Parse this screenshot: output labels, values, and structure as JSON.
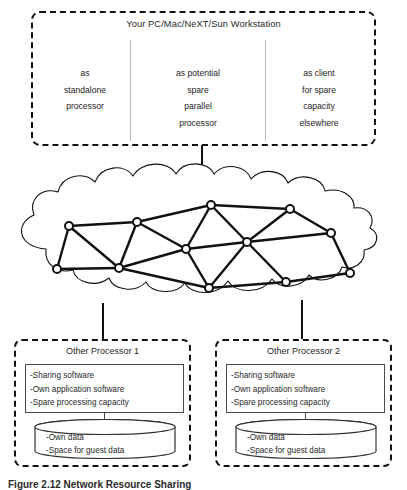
{
  "workstation": {
    "title": "Your PC/Mac/NeXT/Sun Workstation",
    "columns": [
      {
        "name": "standalone",
        "lines": [
          "as",
          "standalone",
          "processor"
        ]
      },
      {
        "name": "parallel",
        "lines": [
          "as potential",
          "spare",
          "parallel",
          "processor"
        ]
      },
      {
        "name": "client",
        "lines": [
          "as client",
          "for spare",
          "capacity",
          "elsewhere"
        ]
      }
    ]
  },
  "network": {
    "label": "network-cloud",
    "node_count": 12,
    "nodes": [
      {
        "id": 1,
        "x": 57,
        "y": 269
      },
      {
        "id": 2,
        "x": 69,
        "y": 226
      },
      {
        "id": 3,
        "x": 119,
        "y": 268
      },
      {
        "id": 4,
        "x": 137,
        "y": 222
      },
      {
        "id": 5,
        "x": 186,
        "y": 249
      },
      {
        "id": 6,
        "x": 211,
        "y": 205
      },
      {
        "id": 7,
        "x": 209,
        "y": 288
      },
      {
        "id": 8,
        "x": 247,
        "y": 242
      },
      {
        "id": 9,
        "x": 290,
        "y": 209
      },
      {
        "id": 10,
        "x": 286,
        "y": 282
      },
      {
        "id": 11,
        "x": 331,
        "y": 233
      },
      {
        "id": 12,
        "x": 350,
        "y": 273
      }
    ],
    "edges": [
      [
        1,
        2
      ],
      [
        1,
        3
      ],
      [
        2,
        4
      ],
      [
        2,
        3
      ],
      [
        3,
        4
      ],
      [
        3,
        5
      ],
      [
        3,
        7
      ],
      [
        4,
        6
      ],
      [
        4,
        5
      ],
      [
        5,
        6
      ],
      [
        5,
        7
      ],
      [
        5,
        8
      ],
      [
        6,
        8
      ],
      [
        6,
        9
      ],
      [
        7,
        8
      ],
      [
        7,
        10
      ],
      [
        8,
        9
      ],
      [
        8,
        10
      ],
      [
        8,
        11
      ],
      [
        9,
        11
      ],
      [
        10,
        12
      ],
      [
        11,
        12
      ]
    ]
  },
  "processors": [
    {
      "title": "Other Processor 1",
      "capabilities": [
        "-Sharing  software",
        "-Own application software",
        "-Spare processing capacity"
      ],
      "datastore": [
        "-Own data",
        "-Space for guest data"
      ]
    },
    {
      "title": "Other Processor 2",
      "capabilities": [
        "-Sharing software",
        "-Own application software",
        "-Spare processing capacity"
      ],
      "datastore": [
        "-Own data",
        "-Space for guest data"
      ]
    }
  ],
  "caption": "Figure 2.12  Network Resource Sharing",
  "colors": {
    "line": "#111111",
    "divider": "#b9b9b9",
    "box_border": "#4a4a4a",
    "text": "#1f1f1f"
  }
}
